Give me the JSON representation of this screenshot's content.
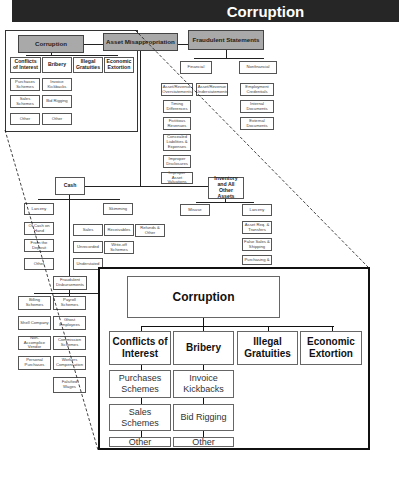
{
  "header": {
    "title": "Corruption"
  },
  "tree": {
    "root_branches": [
      "Corruption",
      "Asset Misappropriation",
      "Fraudulent Statements"
    ],
    "corruption": {
      "categories": [
        "Conflicts of Interest",
        "Bribery",
        "Illegal Gratuities",
        "Economic Extortion"
      ],
      "conflicts_children": [
        "Purchases Schemes",
        "Sales Schemes",
        "Other"
      ],
      "bribery_children": [
        "Invoice Kickbacks",
        "Bid Rigging",
        "Other"
      ]
    },
    "fraudulent_statements": {
      "financial": "Financial",
      "nonfinancial": "Nonfinancial",
      "financial_children": [
        "Asset/Revenue Overstatements",
        "Asset/Revenue Understatements"
      ],
      "overstatement_children": [
        "Timing Differences",
        "Fictitious Revenues",
        "Concealed Liabilities & Expenses",
        "Improper Disclosures",
        "Improper Asset Valuations"
      ],
      "nonfinancial_children": [
        "Employment Credentials",
        "Internal Documents",
        "External Documents"
      ]
    },
    "asset_misappropriation": {
      "cash": "Cash",
      "inventory": "Inventory and All Other Assets",
      "cash_children": [
        "Larceny",
        "Skimming",
        "Fraudulent Disbursements"
      ],
      "larceny_children": [
        "Of Cash on Hand",
        "From the Deposit",
        "Other"
      ],
      "skimming_children": [
        "Sales",
        "Receivables",
        "Refunds & Other"
      ],
      "sales_children": [
        "Unrecorded",
        "Understated"
      ],
      "receivables_children": [
        "Write-off Schemes"
      ],
      "disbursement_children": [
        "Billing Schemes",
        "Payroll Schemes"
      ],
      "billing_children": [
        "Shell Company",
        "Non-Accomplice Vendor",
        "Personal Purchases"
      ],
      "payroll_children": [
        "Ghost Employees",
        "Commission Schemes",
        "Workers Compensation",
        "Falsified Wages"
      ],
      "inventory_children": [
        "Misuse",
        "Larceny"
      ],
      "inv_larceny_children": [
        "Asset Req. & Transfers",
        "False Sales & Shipping",
        "Purchasing &"
      ]
    }
  },
  "zoom_panel": {
    "title": "Corruption",
    "categories": [
      "Conflicts of Interest",
      "Bribery",
      "Illegal Gratuities",
      "Economic Extortion"
    ],
    "conflicts_children": [
      "Purchases Schemes",
      "Sales Schemes",
      "Other"
    ],
    "bribery_children": [
      "Invoice Kickbacks",
      "Bid Rigging",
      "Other"
    ]
  }
}
